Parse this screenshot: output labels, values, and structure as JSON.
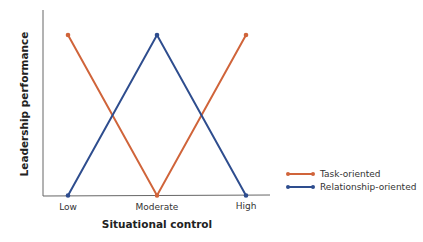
{
  "chart_data": {
    "type": "line",
    "title": "",
    "xlabel": "Situational control",
    "ylabel": "Leadership performance",
    "categories": [
      "Low",
      "Moderate",
      "High"
    ],
    "series": [
      {
        "name": "Task-oriented",
        "color": "#d0643a",
        "values": [
          1,
          0,
          1
        ]
      },
      {
        "name": "Relationship-oriented",
        "color": "#2e4d8e",
        "values": [
          0,
          1,
          0
        ]
      }
    ],
    "ylim": [
      0,
      1.15
    ],
    "grid": false,
    "y_ticks": false,
    "legend_position": "right"
  },
  "axes": {
    "x_title": "Situational control",
    "y_title": "Leadership performance",
    "x_ticks": [
      "Low",
      "Moderate",
      "High"
    ]
  },
  "legend": {
    "items": [
      {
        "label": "Task-oriented",
        "color": "#d0643a"
      },
      {
        "label": "Relationship-oriented",
        "color": "#2e4d8e"
      }
    ]
  }
}
